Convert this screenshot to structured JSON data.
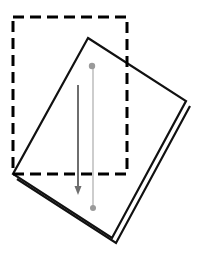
{
  "figure": {
    "title": "",
    "type": "technical-line-diagram",
    "canvas": {
      "width": 198,
      "height": 253,
      "background": "#ffffff"
    },
    "colors": {
      "outline": "#111111",
      "dashed_outline": "#000000",
      "dark_arrow": "#6e6e6e",
      "light_line": "#c8c8c8",
      "dot": "#9a9a9a",
      "sheet_fill": "#ffffff"
    },
    "dashed_rectangle": {
      "label": "reference-frame",
      "x": 13,
      "y": 17,
      "width": 114,
      "height": 157,
      "stroke_width": 3,
      "dash_pattern": "11 6"
    },
    "rotated_sheet": {
      "label": "tilted-sheet",
      "corners": [
        {
          "x": 88,
          "y": 38
        },
        {
          "x": 186,
          "y": 101
        },
        {
          "x": 112,
          "y": 238
        },
        {
          "x": 13,
          "y": 174
        }
      ],
      "stroke_width": 2.2,
      "thickness_offset": {
        "dx": 4,
        "dy": 5
      },
      "thickness_edges": [
        {
          "from": 3,
          "to": 2
        },
        {
          "from": 2,
          "to": 1
        }
      ]
    },
    "dark_arrow": {
      "label": "motion-arrow",
      "x1": 78,
      "y1": 85,
      "x2": 78,
      "y2": 186,
      "stroke_width": 2.0,
      "head_width": 7,
      "head_length": 9
    },
    "light_connector": {
      "label": "reference-axis",
      "x1": 93,
      "y1": 66,
      "x2": 93,
      "y2": 208,
      "stroke_width": 1.8
    },
    "dots": [
      {
        "label": "upper-node",
        "cx": 92,
        "cy": 66,
        "r": 3.2
      },
      {
        "label": "lower-node",
        "cx": 93,
        "cy": 208,
        "r": 3.0
      }
    ]
  }
}
